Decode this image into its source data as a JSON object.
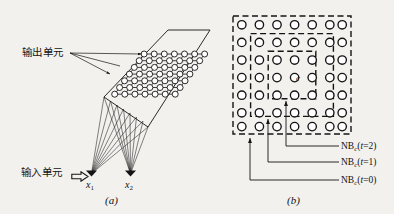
{
  "figure": {
    "background_color": "#f2f1ee",
    "ink_color": "#141414",
    "panels": [
      {
        "id": "a",
        "caption": "(a)",
        "description": "two-dimensional lattice of output units fed by two input units"
      },
      {
        "id": "b",
        "caption": "(b)",
        "description": "nested square neighbourhoods around the centre unit c"
      }
    ]
  },
  "panel_a": {
    "output_units_label": "输出单元",
    "input_units_label": "输入单元",
    "input_arrow_icon": "hollow-right-arrow-icon",
    "caption": "(a)",
    "lattice": {
      "rows": 7,
      "cols": 7,
      "node_count": 49,
      "node_shape": "circle"
    },
    "input_nodes": [
      {
        "label_main": "x",
        "label_sub": "1"
      },
      {
        "label_main": "x",
        "label_sub": "2"
      }
    ]
  },
  "panel_b": {
    "caption": "(b)",
    "center_label": "c",
    "grid": {
      "rows": 7,
      "cols": 7,
      "node_count": 49,
      "node_shape": "circle"
    },
    "neighbourhoods": [
      {
        "prefix": "NB",
        "subscript": "c",
        "open": "(",
        "var": "t",
        "eq": "=",
        "value": "2",
        "close": ")",
        "ring": 2
      },
      {
        "prefix": "NB",
        "subscript": "c",
        "open": "(",
        "var": "t",
        "eq": "=",
        "value": "1",
        "close": ")",
        "ring": 1
      },
      {
        "prefix": "NB",
        "subscript": "c",
        "open": "(",
        "var": "t",
        "eq": "=",
        "value": "0",
        "close": ")",
        "ring": 3
      }
    ]
  }
}
